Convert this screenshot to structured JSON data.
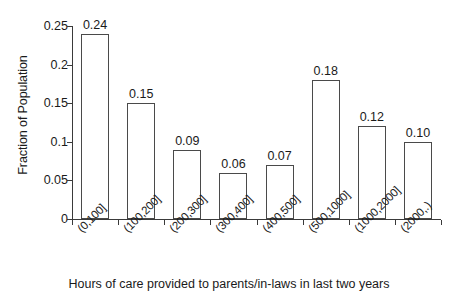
{
  "chart_data": {
    "type": "bar",
    "title": "",
    "subtitle": "",
    "xlabel": "Hours of care provided to parents/in-laws in last two years",
    "ylabel": "Fraction of Population",
    "categories": [
      "(0,100]",
      "(100,200]",
      "(200,300]",
      "(300,400]",
      "(400,500]",
      "(500,1000]",
      "(1000,2000]",
      "(2000,.)"
    ],
    "values": [
      0.24,
      0.15,
      0.09,
      0.06,
      0.07,
      0.18,
      0.12,
      0.1
    ],
    "data_labels": [
      "0.24",
      "0.15",
      "0.09",
      "0.06",
      "0.07",
      "0.18",
      "0.12",
      "0.10"
    ],
    "ylim": [
      0,
      0.25
    ],
    "yticks": [
      0,
      0.05,
      0.1,
      0.15,
      0.2,
      0.25
    ],
    "ytick_labels": [
      "0",
      "0.05",
      "0.1",
      "0.15",
      "0.2",
      "0.25"
    ],
    "grid": false,
    "legend": null,
    "bar_fill_color": "#ffffff",
    "bar_edge_color": "#4a4a4a",
    "axis_color": "#3a3a3a",
    "background_color": "#ffffff"
  }
}
